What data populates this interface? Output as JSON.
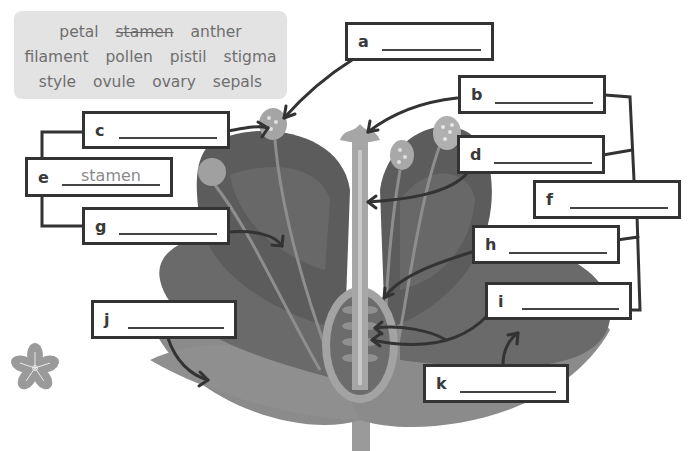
{
  "word_bank": {
    "rows": [
      [
        {
          "text": "petal",
          "struck": false
        },
        {
          "text": "stamen",
          "struck": true
        },
        {
          "text": "anther",
          "struck": false
        }
      ],
      [
        {
          "text": "filament",
          "struck": false
        },
        {
          "text": "pollen",
          "struck": false
        },
        {
          "text": "pistil",
          "struck": false
        },
        {
          "text": "stigma",
          "struck": false
        }
      ],
      [
        {
          "text": "style",
          "struck": false
        },
        {
          "text": "ovule",
          "struck": false
        },
        {
          "text": "ovary",
          "struck": false
        },
        {
          "text": "sepals",
          "struck": false
        }
      ]
    ]
  },
  "labels": {
    "a": {
      "letter": "a",
      "answer": ""
    },
    "b": {
      "letter": "b",
      "answer": ""
    },
    "c": {
      "letter": "c",
      "answer": ""
    },
    "d": {
      "letter": "d",
      "answer": ""
    },
    "e": {
      "letter": "e",
      "answer": "stamen"
    },
    "f": {
      "letter": "f",
      "answer": ""
    },
    "g": {
      "letter": "g",
      "answer": ""
    },
    "h": {
      "letter": "h",
      "answer": ""
    },
    "i": {
      "letter": "i",
      "answer": ""
    },
    "j": {
      "letter": "j",
      "answer": ""
    },
    "k": {
      "letter": "k",
      "answer": ""
    }
  },
  "colors": {
    "petal_dark": "#5e5e5e",
    "petal_mid": "#727272",
    "petal_light": "#8a8a8a",
    "sepal": "#7d7d7d",
    "stem": "#a3a3a3",
    "anther": "#a9a9a9",
    "connector": "#333333",
    "word_bank_bg": "#e3e3e3"
  }
}
